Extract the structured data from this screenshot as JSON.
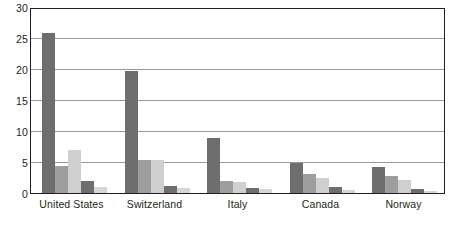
{
  "chart_data": {
    "type": "bar",
    "title": "",
    "subtitle": "",
    "xlabel": "",
    "ylabel": "",
    "ylim": [
      0,
      30
    ],
    "yticks": [
      0,
      5,
      10,
      15,
      20,
      25,
      30
    ],
    "ytick_labels": [
      "0",
      "5",
      "10",
      "15",
      "20",
      "25",
      "30"
    ],
    "grid": true,
    "grid_axis": "y",
    "legend": false,
    "legend_position": "none",
    "categories": [
      "United States",
      "Switzerland",
      "Italy",
      "Canada",
      "Norway"
    ],
    "series": [
      {
        "name": "Series 1",
        "color": "#6e6e6e",
        "values": [
          26.3,
          20.0,
          9.0,
          5.0,
          4.3
        ]
      },
      {
        "name": "Series 2",
        "color": "#9e9e9e",
        "values": [
          4.5,
          5.5,
          2.0,
          3.2,
          2.8
        ]
      },
      {
        "name": "Series 3",
        "color": "#cfcfcf",
        "values": [
          7.0,
          5.5,
          1.8,
          2.5,
          2.2
        ]
      },
      {
        "name": "Series 4",
        "color": "#6e6e6e",
        "values": [
          2.0,
          1.2,
          0.9,
          1.0,
          0.6
        ]
      },
      {
        "name": "Series 5",
        "color": "#d6d6d6",
        "values": [
          1.0,
          0.8,
          0.7,
          0.5,
          0.4
        ]
      }
    ]
  },
  "colors": {
    "axis": "#231f20",
    "grid": "#9a9a9a",
    "background": "#ffffff",
    "bar_dark": "#6e6e6e",
    "bar_medium": "#9e9e9e",
    "bar_light": "#cfcfcf",
    "bar_lightest": "#d6d6d6"
  }
}
